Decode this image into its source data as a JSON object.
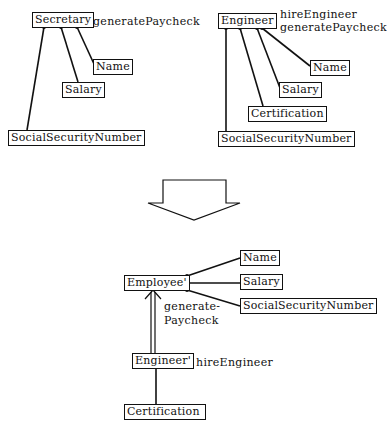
{
  "top_left": {
    "class_name": "Secretary",
    "methods": [
      "generatePaycheck"
    ],
    "attributes": [
      "Name",
      "Salary",
      "SocialSecurityNumber"
    ]
  },
  "top_right": {
    "class_name": "Engineer",
    "methods": [
      "hireEngineer",
      "generatePaycheck"
    ],
    "attributes": [
      "Name",
      "Salary",
      "Certification",
      "SocialSecurityNumber"
    ]
  },
  "bottom": {
    "superclass": {
      "class_name": "Employee'",
      "methods": [
        "generate-",
        "Paycheck"
      ],
      "attributes": [
        "Name",
        "Salary",
        "SocialSecurityNumber"
      ]
    },
    "subclass": {
      "class_name": "Engineer'",
      "methods": [
        "hireEngineer"
      ],
      "attributes": [
        "Certification"
      ]
    }
  },
  "transform_arrow": "down-arrow"
}
